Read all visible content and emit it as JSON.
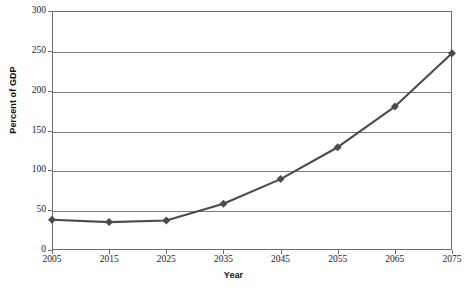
{
  "chart_data": {
    "type": "line",
    "title": "",
    "xlabel": "Year",
    "ylabel": "Percent of GDP",
    "x": [
      2005,
      2015,
      2025,
      2035,
      2045,
      2055,
      2065,
      2075
    ],
    "categories": [
      "2005",
      "2015",
      "2025",
      "2035",
      "2045",
      "2055",
      "2065",
      "2075"
    ],
    "values": [
      38,
      35,
      37,
      58,
      89,
      129,
      180,
      247
    ],
    "series": [
      {
        "name": "Percent of GDP",
        "values": [
          38,
          35,
          37,
          58,
          89,
          129,
          180,
          247
        ]
      }
    ],
    "xlim": [
      2005,
      2075
    ],
    "ylim": [
      0,
      300
    ],
    "ytick_labels": [
      "0",
      "50",
      "100",
      "150",
      "200",
      "250",
      "300"
    ],
    "yticks": [
      0,
      50,
      100,
      150,
      200,
      250,
      300
    ],
    "xtick_labels": [
      "2005",
      "2015",
      "2025",
      "2035",
      "2045",
      "2055",
      "2065",
      "2075"
    ],
    "grid": "horizontal",
    "legend": "none",
    "marker": "diamond",
    "line_color": "#4a4a52",
    "marker_color": "#4a4a52",
    "grid_color": "#7a7a7a",
    "axis_color": "#6d6d6d",
    "background_color": "#ffffff"
  }
}
